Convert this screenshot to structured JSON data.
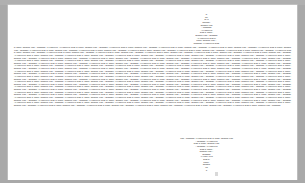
{
  "document": {
    "page_background": "#ffffff",
    "app_background": "#a9a9a9",
    "text_color": "#2b2b2b",
    "top_pyramid": {
      "name": "top-centered-text-pyramid",
      "lines": [
        "DI",
        "OCI",
        "ELAS",
        "DOCORRA",
        "BRONCO TION",
        "A BRONDER",
        "AJAKONTWIKO",
        "ELSE DI DORRA",
        "BRONCO TION A BRONDER",
        "AJAKONTWIKO ELSE DI",
        "DORRA BRONCO TION A",
        "BRONDER AJAKONTWIKO ELSE"
      ]
    },
    "body": {
      "name": "main-justified-body",
      "paragraphs": [
        "DI DORRA BRONCO TION A BRONDER AJAKONTWIKO AJAKONTWIKO ELSE DI DORRA BRONCO TION A BRONDER AJAKONTWIKO ELSE DI DORRA BRONCO TION A BRONDER AJAKONTWIKO ELSE DI DORRA BRONCO TION A BRONDER AJAKONTWIKO ELSE DI DORRA BRONCO TION A BRONDER AJAKONTWIKO ELSE DI DORRA BRONCO TION A BRONDER AJAKONTWIKO ELSE DI DORRA BRONCO TION A BRONDER AJAKONTWIKO ELSE DI DORRA BRONCO TION A BRONDER AJAKONTWIKO ELSE DI DORRA BRONCO TION A BRONDER AJAKONTWIKO ELSE DI DORRA BRONCO TION A BRONDER AJAKONTWIKO ELSE DI DORRA BRONCO TION A BRONDER AJAKONTWIKO ELSE DI DORRA BRONCO TION A BRONDER AJAKONTWIKO ELSE DI DORRA BRONCO TION A BRONDER AJAKONTWIKO ELSE DI DORRA BRONCO TION A BRONDER AJAKONTWIKO ELSE DI DORRA BRONCO TION A BRONDER AJAKONTWIKO ELSE DI DORRA BRONCO TION A BRONDER AJAKONTWIKO ELSE DI DORRA BRONCO TION A BRONDER AJAKONTWIKO ELSE DI DORRA BRONCO TION A BRONDER AJAKONTWIKO ELSE DI DORRA BRONCO TION A BRONDER AJAKONTWIKO ELSE DI DORRA BRONCO TION A BRONDER AJAKONTWIKO ELSE DI DORRA BRONCO TION A BRONDER AJAKONTWIKO ELSE DI DORRA BRONCO TION A BRONDER AJAKONTWIKO ELSE DI DORRA BRONCO TION A BRONDER AJAKONTWIKO ELSE DI DORRA BRONCO TION A BRONDER AJAKONTWIKO ELSE DI DORRA BRONCO TION A BRONDER AJAKONTWIKO ELSE DI DORRA BRONCO TION A BRONDER AJAKONTWIKO ELSE DI DORRA BRONCO TION A BRONDER AJAKONTWIKO ELSE DI DORRA BRONCO TION A BRONDER AJAKONTWIKO ELSE DI DORRA BRONCO TION A BRONDER AJAKONTWIKO ELSE DI DORRA BRONCO TION A BRONDER AJAKONTWIKO ELSE DI DORRA BRONCO TION A BRONDER AJAKONTWIKO ELSE DI DORRA BRONCO TION A BRONDER AJAKONTWIKO ELSE DI DORRA BRONCO TION A BRONDER AJAKONTWIKO ELSE DI DORRA BRONCO TION A BRONDER AJAKONTWIKO ELSE DI DORRA BRONCO TION A BRONDER AJAKONTWIKO ELSE DI DORRA BRONCO TION A BRONDER AJAKONTWIKO ELSE DI DORRA BRONCO TION A BRONDER AJAKONTWIKO ELSE DI DORRA BRONCO TION A BRONDER AJAKONTWIKO ELSE DI DORRA BRONCO TION A BRONDER AJAKONTWIKO ELSE DI DORRA BRONCO TION A BRONDER AJAKONTWIKO ELSE DI DORRA BRONCO TION A BRONDER AJAKONTWIKO ELSE DI DORRA BRONCO TION A BRONDER AJAKONTWIKO ELSE DI DORRA BRONCO TION A BRONDER AJAKONTWIKO ELSE DI DORRA BRONCO TION A BRONDER AJAKONTWIKO ELSE DI DORRA BRONCO TION A BRONDER AJAKONTWIKO ELSE DI DORRA BRONCO TION A BRONDER AJAKONTWIKO ELSE DI DORRA BRONCO TION A BRONDER AJAKONTWIKO ELSE DI DORRA BRONCO TION A BRONDER AJAKONTWIKO ELSE DI DORRA BRONCO TION A BRONDER AJAKONTWIKO ELSE DI DORRA BRONCO TION A BRONDER AJAKONTWIKO ELSE DI DORRA BRONCO TION A BRONDER AJAKONTWIKO ELSE DI DORRA BRONCO TION A BRONDER AJAKONTWIKO ELSE DI DORRA BRONCO TION A BRONDER AJAKONTWIKO ELSE DI DORRA BRONCO TION A BRONDER AJAKONTWIKO ELSE DI DORRA BRONCO TION A BRONDER AJAKONTWIKO ELSE DI DORRA BRONCO TION A BRONDER AJAKONTWIKO ELSE DI DORRA BRONCO TION A BRONDER AJAKONTWIKO ELSE DI DORRA BRONCO TION A BRONDER AJAKONTWIKO ELSE DI DORRA BRONCO TION A BRONDER AJAKONTWIKO ELSE DI DORRA BRONCO TION A BRONDER AJAKONTWIKO ELSE DI DORRA BRONCO TION A BRONDER AJAKONTWIKO ELSE DI DORRA BRONCO TION A BRONDER AJAKONTWIKO ELSE DI DORRA BRONCO TION A BRONDER AJAKONTWIKO ELSE DI DORRA BRONCO TION A BRONDER AJAKONTWIKO ELSE DI DORRA BRONCO TION A BRONDER AJAKONTWIKO ELSE DI DORRA BRONCO TION A BRONDER AJAKONTWIKO ELSE DI DORRA BRONCO TION A BRONDER AJAKONTWIKO ELSE DI DORRA BRONCO TION A BRONDER AJAKONTWIKO ELSE DI DORRA BRONCO TION A BRONDER AJAKONTWIKO ELSE DI DORRA BRONCO TION A BRONDER AJAKONTWIKO ELSE DI DORRA BRONCO TION A BRONDER AJAKONTWIKO ELSE DI DORRA BRONCO TION A BRONDER AJAKONTWIKO ELSE DI DORRA BRONCO TION A BRONDER AJAKONTWIKO ELSE DI DORRA BRONCO TION A BRONDER AJAKONTWIKO ELSE DI DORRA BRONCO TION A BRONDER AJAKONTWIKO ELSE DI DORRA BRONCO TION A BRONDER AJAKONTWIKO ELSE DI DORRA BRONCO TION A BRONDER AJAKONTWIKO ELSE DI DORRA BRONCO TION A BRONDER AJAKONTWIKO ELSE DI DORRA BRONCO TION A BRONDER AJAKONTWIKO ELSE DI DORRA BRONCO TION A BRONDER AJAKONTWIKO ELSE DI DORRA BRONCO TION A BRONDER AJAKONTWIKO ELSE DI DORRA BRONCO TION A BRONDER AJAKONTWIKO ELSE DI DORRA BRONCO TION A BRONDER AJAKONTWIKO ELSE DI DORRA BRONCO TION A BRONDER AJAKONTWIKO ELSE DI DORRA BRONCO TION A BRONDER AJAKONTWIKO ELSE DI DORRA BRONCO TION A BRONDER AJAKONTWIKO ELSE DI DORRA BRONCO TION A BRONDER AJAKONTWIKO ELSE DI DORRA BRONCO TION A BRONDER AJAKONTWIKO ELSE DI DORRA BRONCO TION A BRONDER AJAKONTWIKO ELSE DI DORRA BRONCO TION A BRONDER AJAKONTWIKO ELSE DI DORRA BRONCO TION A BRONDER AJAKONTWIKO ELSE DI DORRA BRONCO TION A BRONDER AJAKONTWIKO ELSE DI DORRA BRONCO TION A BRONDER AJAKONTWIKO ELSE DI DORRA BRONCO TION A BRONDER AJAKONTWIKO ELSE DI DORRA BRONCO TION A BRONDER AJAKONTWIKO ELSE DI DORRA BRONCO TION A BRONDER AJAKONTWIKO ELSE DI DORRA BRONCO TION A BRONDER AJAKONTWIKO ELSE DI DORRA BRONCO TION A BRONDER AJAKONTWIKO ELSE DI DORRA BRONCO TION A BRONDER AJAKONTWIKO ELSE DI DORRA BRONCO TION A BRONDER AJAKONTWIKO ELSE DI DORRA BRONCO TION A BRONDER AJAKONTWIKO ELSE DI DORRA BRONCO TION A BRONDER AJAKONTWIKO ELSE DI DORRA BRONCO TION A BRONDER AJAKONTWIKO ELSE DI DORRA BRONCO TION A BRONDER AJAKONTWIKO ELSE DI DORRA BRONCO TION A BRONDER AJAKONTWIKO ELSE DI DORRA BRONCO TION A BRONDER AJAKONTWIKO ELSE DI DORRA BRONCO TION A BRONDER AJAKONTWIKO ELSE DI DORRA BRONCO TION A BRONDER AJAKONTWIKO ELSE DI DORRA BRONCO TION A BRONDER AJAKONTWIKO ELSE DI DORRA BRONCO TION A BRONDER AJAKONTWIKO ELSE DI DORRA BRONCO TION A BRONDER AJAKONTWIKO ELSE DI DORRA BRONCO TION A BRONDER AJAKONTWIKO ELSE DI DORRA BRONCO TION A BRONDER AJAKONTWIKO ELSE DI DORRA BRONCO TION A BRONDER AJAKONTWIKO ELSE DI DORRA BRONCO TION A BRONDER AJAKONTWIKO ELSE DI DORRA BRONCO TION A BRONDER AJAKONTWIKO ELSE DI DORRA BRONCO TION A BRONDER AJAKONTWIKO ELSE DI DORRA BRONCO TION A BRONDER AJAKONTWIKO ELSE DI DORRA BRONCO TION A BRONDER AJAKONTWIKO ELSE DI DORRA BRONCO TION A BRONDER AJAKONTWIKO ELSE DI DORRA BRONCO TION A BRONDER AJAKONTWIKO ELSE DI DORRA BRONCO TION A BRONDER AJAKONTWIKO ELSE DI DORRA BRONCO TION A BRONDER AJAKONTWIKO ELSE DI DORRA BRONCO TION A BRONDER AJAKONTWIKO ELSE DI DORRA BRONCO TION A BRONDER AJAKONTWIKO ELSE DI DORRA BRONCO TION A BRONDER AJAKONTWIKO ELSE DI DORRA BRONCO TION A BRONDER"
      ]
    },
    "bottom_pyramid": {
      "name": "bottom-centered-text-pyramid",
      "lines": [
        "TION A BRONDER AJAKONTWIKO ELSE DI DORRA BRONCO TION",
        "A BRONDER AJAKONTWIKO",
        "ELSE DI DORRA BRONCO TION",
        "A BRONDER AJAKONTWIKO",
        "ELSE DI DORRA",
        "BRONCO TION A",
        "BRONDER",
        "AJAKONT WIKO",
        "ELSE DI",
        "DORRA",
        "BRONCO",
        "TIO",
        "D"
      ]
    }
  }
}
